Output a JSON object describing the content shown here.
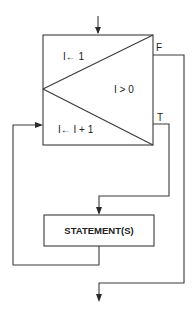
{
  "diagram": {
    "type": "flowchart",
    "loop_box": {
      "init_label": "I← 1",
      "condition_label": "I > 0",
      "increment_label": "I← I + 1"
    },
    "branches": {
      "false_label": "F",
      "true_label": "T"
    },
    "statement_box": {
      "label": "STATEMENT(S)"
    },
    "colors": {
      "line": "#3a3a3a",
      "background": "#ffffff",
      "text": "#222222"
    }
  }
}
